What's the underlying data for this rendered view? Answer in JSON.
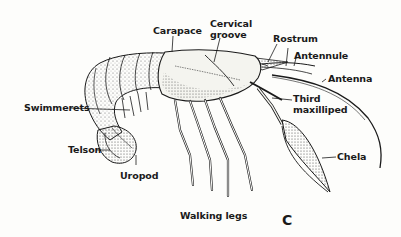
{
  "diagram": {
    "panel_letter": "C",
    "colors": {
      "ink": "#1a1a1a",
      "background": "#fdfdfb",
      "shading": "#555555"
    },
    "labels": {
      "carapace": "Carapace",
      "cervical_groove_1": "Cervical",
      "cervical_groove_2": "groove",
      "rostrum": "Rostrum",
      "antennule": "Antennule",
      "antenna": "Antenna",
      "third_maxilliped_1": "Third",
      "third_maxilliped_2": "maxilliped",
      "swimmerets": "Swimmerets",
      "telson": "Telson",
      "uropod": "Uropod",
      "chela": "Chela",
      "walking_legs": "Walking legs"
    }
  }
}
